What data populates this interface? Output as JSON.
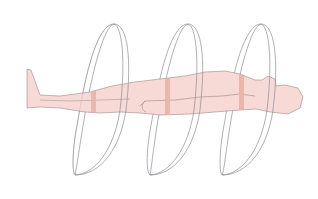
{
  "figure": {
    "colors": {
      "background": "#ffffff",
      "body_fill": "#f7d9d6",
      "body_stroke": "#9a8a88",
      "slice_band": "#e8b4a6",
      "ring_stroke": "#8e8e96",
      "ring_fill": "#f4f4f6"
    },
    "rings": [
      {
        "name": "ring-1",
        "top": [
          114,
          24
        ],
        "bottom": [
          75,
          175
        ]
      },
      {
        "name": "ring-2",
        "top": [
          188,
          24
        ],
        "bottom": [
          150,
          175
        ]
      },
      {
        "name": "ring-3",
        "top": [
          261,
          24
        ],
        "bottom": [
          222,
          175
        ]
      }
    ],
    "slice_bands": [
      {
        "name": "band-legs",
        "x": 93
      },
      {
        "name": "band-torso",
        "x": 167
      },
      {
        "name": "band-chest",
        "x": 241
      }
    ]
  }
}
